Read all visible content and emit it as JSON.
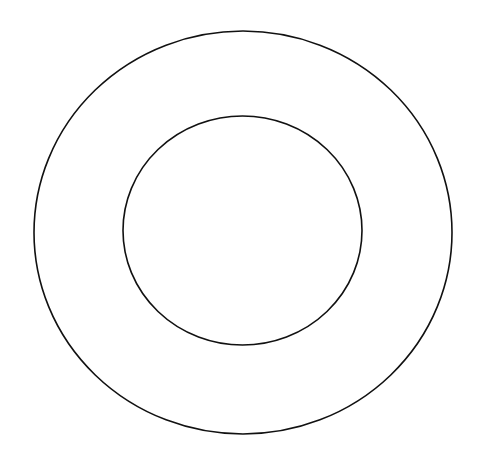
{
  "diagram": {
    "background": "#ffffff",
    "stroke_color": "#111111",
    "shapes": [
      {
        "name": "outer-ellipse",
        "cx": 243,
        "cy": 232.5,
        "rx": 209,
        "ry": 201.5
      },
      {
        "name": "inner-ellipse",
        "cx": 242.5,
        "cy": 230.5,
        "rx": 119.5,
        "ry": 114.5
      }
    ]
  }
}
